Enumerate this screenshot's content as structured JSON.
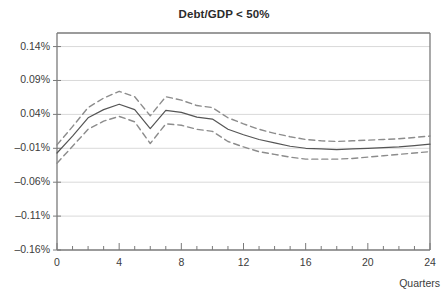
{
  "chart_data": {
    "type": "line",
    "title": "Debt/GDP < 50%",
    "xlabel": "Quarters",
    "ylabel": "",
    "xlim": [
      0,
      24
    ],
    "ylim": [
      -0.16,
      0.16
    ],
    "grid": true,
    "legend": null,
    "x": [
      0,
      1,
      2,
      3,
      4,
      5,
      6,
      7,
      8,
      9,
      10,
      11,
      12,
      13,
      14,
      15,
      16,
      17,
      18,
      19,
      20,
      21,
      22,
      23,
      24
    ],
    "series": [
      {
        "name": "point-estimate",
        "style": "solid",
        "color": "#555555",
        "values": [
          -0.017,
          0.008,
          0.035,
          0.047,
          0.055,
          0.047,
          0.019,
          0.046,
          0.043,
          0.036,
          0.033,
          0.018,
          0.01,
          0.003,
          -0.002,
          -0.007,
          -0.01,
          -0.011,
          -0.012,
          -0.011,
          -0.01,
          -0.009,
          -0.008,
          -0.006,
          -0.004
        ]
      },
      {
        "name": "upper-confidence-band",
        "style": "dashed",
        "color": "#8c8c8c",
        "values": [
          -0.005,
          0.022,
          0.05,
          0.064,
          0.074,
          0.066,
          0.038,
          0.066,
          0.061,
          0.053,
          0.05,
          0.035,
          0.026,
          0.018,
          0.012,
          0.007,
          0.003,
          0.001,
          0.0,
          0.001,
          0.002,
          0.003,
          0.004,
          0.006,
          0.008
        ]
      },
      {
        "name": "lower-confidence-band",
        "style": "dashed",
        "color": "#8c8c8c",
        "values": [
          -0.032,
          -0.007,
          0.018,
          0.03,
          0.037,
          0.029,
          -0.003,
          0.026,
          0.024,
          0.018,
          0.015,
          0.0,
          -0.008,
          -0.015,
          -0.019,
          -0.023,
          -0.026,
          -0.026,
          -0.026,
          -0.025,
          -0.023,
          -0.021,
          -0.019,
          -0.017,
          -0.015
        ]
      }
    ],
    "yticks": [
      {
        "value": 0.14,
        "label": "0.14%"
      },
      {
        "value": 0.09,
        "label": "0.09%"
      },
      {
        "value": 0.04,
        "label": "0.04%"
      },
      {
        "value": -0.01,
        "label": "–0.01%"
      },
      {
        "value": -0.06,
        "label": "–0.06%"
      },
      {
        "value": -0.11,
        "label": "–0.11%"
      },
      {
        "value": -0.16,
        "label": "–0.16%"
      }
    ],
    "xticks": [
      {
        "value": 0,
        "label": "0"
      },
      {
        "value": 4,
        "label": "4"
      },
      {
        "value": 8,
        "label": "8"
      },
      {
        "value": 12,
        "label": "12"
      },
      {
        "value": 16,
        "label": "16"
      },
      {
        "value": 20,
        "label": "20"
      },
      {
        "value": 24,
        "label": "24"
      }
    ],
    "minor_xticks": [
      1,
      2,
      3,
      5,
      6,
      7,
      9,
      10,
      11,
      13,
      14,
      15,
      17,
      18,
      19,
      21,
      22,
      23
    ],
    "colors": {
      "axis": "#7a7a7a",
      "grid": "#d9d9d9",
      "solid_line": "#555555",
      "dashed_line": "#8c8c8c",
      "text": "#3c3c3c",
      "background": "#ffffff"
    }
  }
}
